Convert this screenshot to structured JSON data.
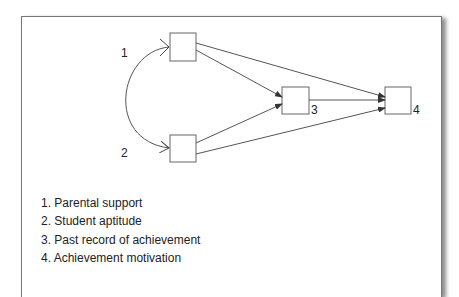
{
  "diagram": {
    "type": "path-diagram",
    "nodes": [
      {
        "id": "1",
        "label": "1"
      },
      {
        "id": "2",
        "label": "2"
      },
      {
        "id": "3",
        "label": "3"
      },
      {
        "id": "4",
        "label": "4"
      }
    ],
    "edges": [
      {
        "from": "1",
        "to": "2",
        "kind": "curved-bidirectional"
      },
      {
        "from": "1",
        "to": "3",
        "kind": "directed"
      },
      {
        "from": "1",
        "to": "4",
        "kind": "directed"
      },
      {
        "from": "2",
        "to": "3",
        "kind": "directed"
      },
      {
        "from": "2",
        "to": "4",
        "kind": "directed"
      },
      {
        "from": "3",
        "to": "4",
        "kind": "directed"
      }
    ]
  },
  "legend": {
    "items": [
      "1. Parental support",
      "2. Student aptitude",
      "3. Past record of achievement",
      "4. Achievement motivation"
    ]
  },
  "colors": {
    "line": "#555555",
    "frame": "#777777",
    "text": "#222222"
  }
}
